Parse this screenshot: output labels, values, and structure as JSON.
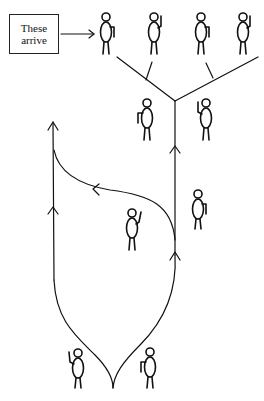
{
  "diagram": {
    "label_box": {
      "line1": "These",
      "line2": "arrive"
    },
    "colors": {
      "ink": "#111111",
      "background": "#ffffff"
    },
    "figures": [
      {
        "id": "arriving-1",
        "x": 106,
        "y": 12,
        "arm": "right-down"
      },
      {
        "id": "arriving-2",
        "x": 155,
        "y": 12,
        "arm": "right-up"
      },
      {
        "id": "arriving-3",
        "x": 202,
        "y": 12,
        "arm": "right-down"
      },
      {
        "id": "arriving-4",
        "x": 243,
        "y": 12,
        "arm": "right-up"
      },
      {
        "id": "waiting-left",
        "x": 145,
        "y": 95,
        "arm": "left-down"
      },
      {
        "id": "waiting-right",
        "x": 206,
        "y": 95,
        "arm": "left-up"
      },
      {
        "id": "middle-right",
        "x": 198,
        "y": 188,
        "arm": "right-down"
      },
      {
        "id": "middle-center",
        "x": 133,
        "y": 207,
        "arm": "right-up"
      },
      {
        "id": "bottom-left",
        "x": 77,
        "y": 348,
        "arm": "left-up"
      },
      {
        "id": "bottom-right",
        "x": 149,
        "y": 346,
        "arm": "left-down"
      }
    ]
  }
}
